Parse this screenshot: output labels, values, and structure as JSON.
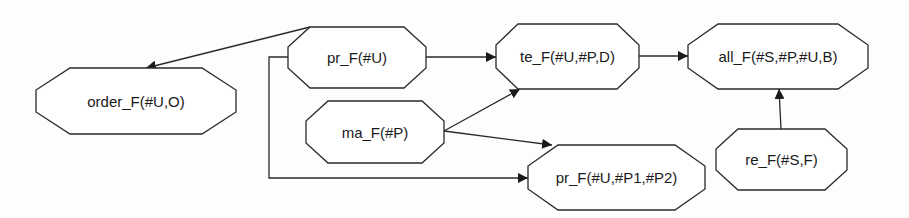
{
  "diagram": {
    "type": "dependency-graph",
    "nodes": [
      {
        "id": "order",
        "label": "order_F(#U,O)",
        "x": 36,
        "y": 68,
        "w": 200,
        "h": 66,
        "c": 34
      },
      {
        "id": "pr_u",
        "label": "pr_F(#U)",
        "x": 288,
        "y": 27,
        "w": 138,
        "h": 61,
        "c": 22
      },
      {
        "id": "ma",
        "label": "ma_F(#P)",
        "x": 306,
        "y": 101,
        "w": 138,
        "h": 62,
        "c": 22
      },
      {
        "id": "te",
        "label": "te_F(#U,#P,D)",
        "x": 496,
        "y": 24,
        "w": 143,
        "h": 65,
        "c": 22
      },
      {
        "id": "all",
        "label": "all_F(#S,#P,#U,B)",
        "x": 688,
        "y": 24,
        "w": 180,
        "h": 65,
        "c": 30
      },
      {
        "id": "re",
        "label": "re_F(#S,F)",
        "x": 716,
        "y": 129,
        "w": 131,
        "h": 61,
        "c": 22
      },
      {
        "id": "pr_upp",
        "label": "pr_F(#U,#P1,#P2)",
        "x": 528,
        "y": 145,
        "w": 177,
        "h": 65,
        "c": 30
      }
    ],
    "edges": [
      {
        "from": "pr_u",
        "to": "order",
        "points": [
          [
            310,
            27
          ],
          [
            146,
            68
          ]
        ]
      },
      {
        "from": "pr_u",
        "to": "te",
        "points": [
          [
            426,
            57
          ],
          [
            496,
            57
          ]
        ]
      },
      {
        "from": "te",
        "to": "all",
        "points": [
          [
            639,
            56
          ],
          [
            688,
            56
          ]
        ]
      },
      {
        "from": "ma",
        "to": "te",
        "points": [
          [
            444,
            131
          ],
          [
            520,
            89
          ]
        ]
      },
      {
        "from": "ma",
        "to": "pr_upp",
        "points": [
          [
            444,
            131
          ],
          [
            552,
            145
          ]
        ]
      },
      {
        "from": "pr_u",
        "to": "pr_upp",
        "points": [
          [
            288,
            57
          ],
          [
            269,
            57
          ],
          [
            269,
            178
          ],
          [
            528,
            178
          ]
        ]
      },
      {
        "from": "re",
        "to": "all",
        "points": [
          [
            781,
            129
          ],
          [
            779,
            89
          ]
        ]
      }
    ],
    "colors": {
      "stroke": "#2a2a2a",
      "fill": "#ffffff",
      "text": "#1a1a1a"
    }
  }
}
